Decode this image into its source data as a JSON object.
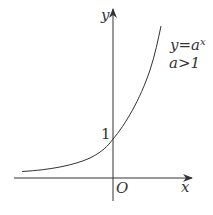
{
  "diagram": {
    "axes": {
      "x_label": "x",
      "y_label": "y",
      "origin_label": "O"
    },
    "annotations": {
      "equation_base": "y=a",
      "equation_exp": "x",
      "condition": "a>1",
      "y_intercept_label": "1"
    },
    "curve": {
      "type": "exponential",
      "passes_through": [
        0,
        1
      ],
      "asymptote": "y=0"
    },
    "colors": {
      "stroke": "#333333",
      "background": "#ffffff"
    }
  }
}
